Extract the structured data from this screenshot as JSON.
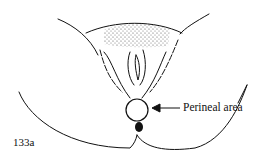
{
  "diagram": {
    "callout_label": "Perineal area",
    "figure_number": "133a",
    "colors": {
      "line": "#111111",
      "background": "#ffffff"
    }
  }
}
